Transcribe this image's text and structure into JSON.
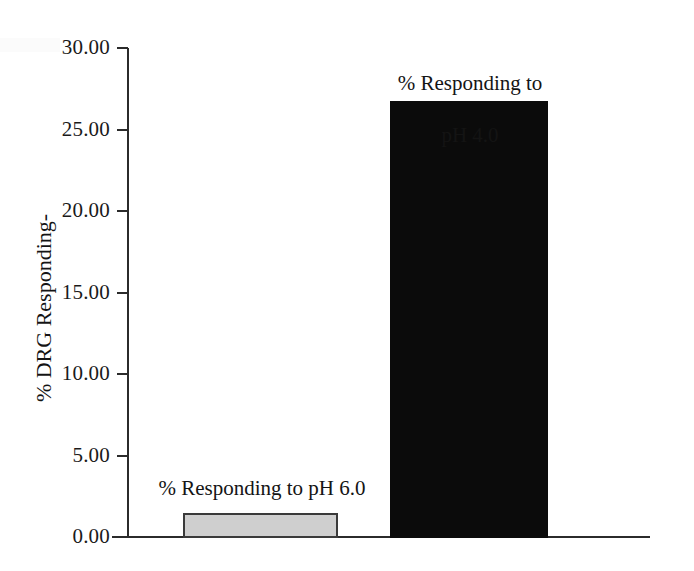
{
  "chart_data": {
    "type": "bar",
    "title": "",
    "subtitle": "",
    "xlabel": "",
    "ylabel": "% DRG Responding-",
    "ylim": [
      0,
      30
    ],
    "ytick_values": [
      0,
      5,
      10,
      15,
      20,
      25,
      30
    ],
    "ytick_labels": [
      "0.00",
      "5.00",
      "10.00",
      "15.00",
      "20.00",
      "25.00",
      "30.00"
    ],
    "grid": false,
    "legend": "none",
    "categories": [
      "% Responding to pH 6.0",
      "% Responding to pH 4.0"
    ],
    "values": [
      1.47,
      26.75
    ],
    "annotations": [
      {
        "text": "% Responding to pH 6.0",
        "for": "% Responding to pH 6.0",
        "position": "above-bar"
      },
      {
        "text": "% Responding to\npH 4.0",
        "for": "% Responding to pH 4.0",
        "position": "above-bar"
      }
    ],
    "series": [
      {
        "name": "% DRG Responding",
        "values": [
          1.47,
          26.75
        ],
        "colors": [
          "#cfcfcf",
          "#0b0b0b"
        ]
      }
    ],
    "colors": {
      "bar_light_fill": "#cfcfcf",
      "bar_light_border": "#3a3a3a",
      "bar_dark_fill": "#0b0b0b",
      "axis": "#2b2b2b",
      "text": "#141414",
      "background": "#ffffff"
    }
  },
  "axis": {
    "y_title": "% DRG Responding-",
    "ticks": [
      {
        "label": "30.00",
        "value": 30
      },
      {
        "label": "25.00",
        "value": 25
      },
      {
        "label": "20.00",
        "value": 20
      },
      {
        "label": "15.00",
        "value": 15
      },
      {
        "label": "10.00",
        "value": 10
      },
      {
        "label": "5.00",
        "value": 5
      },
      {
        "label": "0.00",
        "value": 0
      }
    ]
  },
  "bars": {
    "light": {
      "label": "% Responding to pH 6.0",
      "value": 1.47
    },
    "dark": {
      "label_line1": "% Responding to",
      "label_line2": "pH 4.0",
      "label": "% Responding to pH 4.0",
      "value": 26.75
    }
  },
  "artifact": {
    "bleed_text": ""
  }
}
